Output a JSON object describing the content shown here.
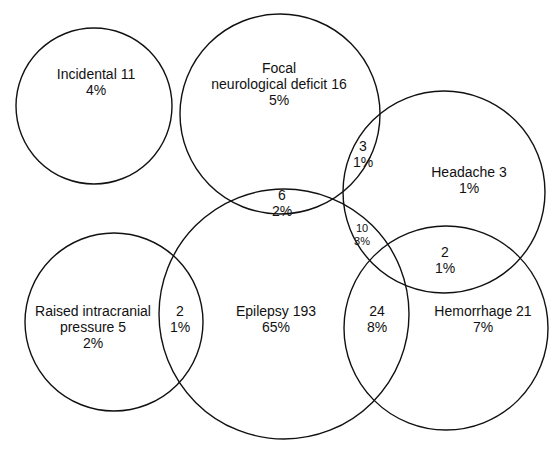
{
  "diagram": {
    "type": "venn",
    "stroke_color": "#111111",
    "sets": [
      {
        "id": "incidental",
        "label": "Incidental 11",
        "pct": "4%",
        "cx": 94,
        "cy": 106,
        "r": 78
      },
      {
        "id": "focal",
        "label_line1": "Focal",
        "label_line2": "neurological deficit 16",
        "pct": "5%",
        "cx": 280,
        "cy": 114,
        "r": 100
      },
      {
        "id": "headache",
        "label": "Headache 3",
        "pct": "1%",
        "cx": 444,
        "cy": 192,
        "r": 101
      },
      {
        "id": "epilepsy",
        "label": "Epilepsy 193",
        "pct": "65%",
        "cx": 284,
        "cy": 314,
        "r": 125
      },
      {
        "id": "raised",
        "label_line1": "Raised intracranial",
        "label_line2": "pressure 5",
        "pct": "2%",
        "cx": 114,
        "cy": 322,
        "r": 89
      },
      {
        "id": "hemorrhage",
        "label": "Hemorrhage 21",
        "pct": "7%",
        "cx": 446,
        "cy": 328,
        "r": 102
      }
    ],
    "overlaps": [
      {
        "id": "focal-headache",
        "count": "3",
        "pct": "1%"
      },
      {
        "id": "focal-epilepsy",
        "count": "6",
        "pct": "2%"
      },
      {
        "id": "epilepsy-headache",
        "count": "10",
        "pct": "3%"
      },
      {
        "id": "headache-hemorrhage",
        "count": "2",
        "pct": "1%"
      },
      {
        "id": "raised-epilepsy",
        "count": "2",
        "pct": "1%"
      },
      {
        "id": "epilepsy-hemorrhage",
        "count": "24",
        "pct": "8%"
      }
    ]
  }
}
